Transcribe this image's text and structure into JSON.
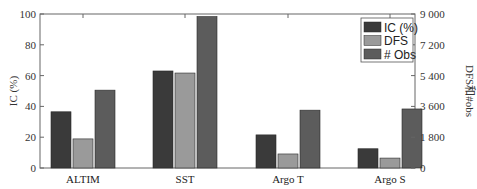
{
  "chart_data": {
    "type": "bar",
    "title": "",
    "categories": [
      "ALTIM",
      "SST",
      "Argo T",
      "Argo S"
    ],
    "xlabel": "",
    "ylabel": "IC (%)",
    "ylabel_right": "DFS和#obs",
    "ylim": [
      0,
      100
    ],
    "ylim_right": [
      0,
      9000
    ],
    "yticks": [
      "0",
      "20",
      "40",
      "60",
      "80",
      "100"
    ],
    "yticks_right": [
      "0",
      "1 800",
      "3 600",
      "5 400",
      "7 200",
      "9 000"
    ],
    "grid": false,
    "legend_position": "upper right",
    "series": [
      {
        "name": "IC (%)",
        "axis": "left",
        "color": "#3a3a3a",
        "values": [
          36.5,
          63,
          21.5,
          12.5
        ]
      },
      {
        "name": "DFS",
        "axis": "right",
        "color": "#9a9a9a",
        "values": [
          1700,
          5550,
          820,
          580
        ]
      },
      {
        "name": "# Obs",
        "axis": "right",
        "color": "#5c5c5c",
        "values": [
          4550,
          8850,
          3380,
          3450
        ]
      }
    ]
  }
}
